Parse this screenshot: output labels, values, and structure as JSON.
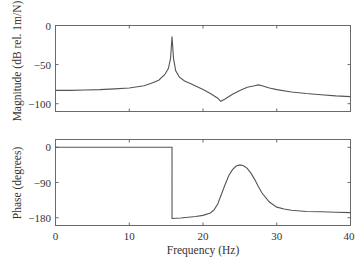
{
  "chart_data": [
    {
      "type": "line",
      "title": "",
      "xlabel": "",
      "ylabel": "Magnitude (dB rel. 1m/N)",
      "xlim": [
        0,
        40
      ],
      "ylim": [
        -110,
        0
      ],
      "xticks": [
        0,
        10,
        20,
        30,
        40
      ],
      "xtick_labels_shown": false,
      "yticks": [
        0,
        -50,
        -100
      ],
      "ytick_labels": [
        "0",
        "−50",
        "−100"
      ],
      "grid": false,
      "legend": null,
      "series": [
        {
          "name": "Magnitude",
          "x": [
            0,
            2,
            4,
            6,
            8,
            10,
            12,
            13,
            14,
            14.8,
            15.3,
            15.6,
            15.8,
            16.0,
            16.3,
            16.8,
            17.5,
            18.5,
            20,
            21,
            22,
            22.4,
            23,
            24,
            25,
            26,
            27,
            27.5,
            28,
            29,
            30,
            32,
            34,
            36,
            38,
            40
          ],
          "y": [
            -83,
            -83,
            -82.5,
            -82,
            -81,
            -80,
            -77,
            -74,
            -70,
            -63,
            -55,
            -42,
            -14,
            -42,
            -58,
            -66,
            -71,
            -75,
            -82,
            -87,
            -93,
            -97,
            -94,
            -88,
            -83,
            -79,
            -77,
            -76,
            -77,
            -80,
            -82,
            -85,
            -87,
            -88.5,
            -90,
            -91
          ]
        }
      ]
    },
    {
      "type": "line",
      "title": "",
      "xlabel": "Frequency (Hz)",
      "ylabel": "Phase (degrees)",
      "xlim": [
        0,
        40
      ],
      "ylim": [
        -200,
        20
      ],
      "xticks": [
        0,
        10,
        20,
        30,
        40
      ],
      "xtick_labels": [
        "0",
        "10",
        "20",
        "30",
        "40"
      ],
      "yticks": [
        0,
        -90,
        -180
      ],
      "ytick_labels": [
        "0",
        "−90",
        "−180"
      ],
      "grid": false,
      "legend": null,
      "series": [
        {
          "name": "Phase",
          "x": [
            0,
            15.8,
            15.8,
            17,
            18,
            19,
            20,
            21,
            21.5,
            22,
            22.5,
            23,
            23.5,
            24,
            24.5,
            25,
            25.5,
            26,
            26.5,
            27,
            27.5,
            28,
            29,
            30,
            31,
            32,
            34,
            36,
            38,
            40
          ],
          "y": [
            0,
            0,
            -182,
            -181,
            -179,
            -177,
            -174,
            -168,
            -160,
            -145,
            -120,
            -95,
            -72,
            -57,
            -48,
            -45,
            -47,
            -54,
            -66,
            -82,
            -100,
            -117,
            -140,
            -153,
            -158,
            -161,
            -164,
            -165,
            -166,
            -167
          ]
        }
      ]
    }
  ],
  "plots": {
    "magnitude": {
      "ylabel": "Magnitude (dB rel. 1m/N)",
      "ytick_labels": [
        "0",
        "−50",
        "−100"
      ]
    },
    "phase": {
      "ylabel": "Phase (degrees)",
      "ytick_labels": [
        "0",
        "−90",
        "−180"
      ],
      "xtick_labels": [
        "0",
        "10",
        "20",
        "30",
        "40"
      ],
      "xlabel": "Frequency (Hz)"
    }
  },
  "colors": {
    "line": "#555555",
    "frame": "#6a6a6a",
    "background": "#ffffff"
  }
}
